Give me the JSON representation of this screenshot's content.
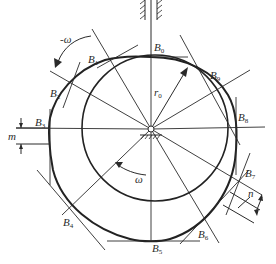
{
  "diagram": {
    "type": "cam-profile-construction",
    "colors": {
      "line": "#2a2a2a",
      "background": "#ffffff"
    },
    "labels": {
      "B0": "B",
      "B0_sub": "0",
      "B1": "B",
      "B1_sub": "1",
      "B2": "B",
      "B2_sub": "2",
      "B3": "B",
      "B3_sub": "3",
      "B4": "B",
      "B4_sub": "4",
      "B5": "B",
      "B5_sub": "5",
      "B6": "B",
      "B6_sub": "6",
      "B7": "B",
      "B7_sub": "7",
      "B8": "B",
      "B8_sub": "8",
      "B9": "B",
      "B9_sub": "9",
      "r0": "r",
      "r0_sub": "0",
      "omega": "ω",
      "neg_omega": "-ω",
      "m": "m",
      "n": "n"
    }
  }
}
